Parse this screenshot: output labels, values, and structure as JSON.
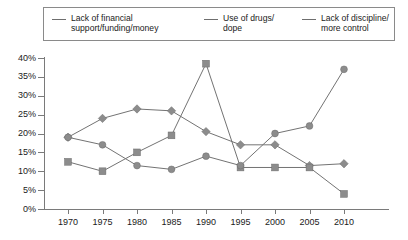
{
  "legend": {
    "items": [
      {
        "label": "Lack of financial\nsupport/funding/money",
        "marker": "diamond",
        "color": "#8c8c8c"
      },
      {
        "label": "Use of drugs/\ndope",
        "marker": "square",
        "color": "#8c8c8c"
      },
      {
        "label": "Lack of discipline/\nmore control",
        "marker": "circle",
        "color": "#8c8c8c"
      }
    ]
  },
  "axes": {
    "y_ticks": [
      "0%",
      "5%",
      "10%",
      "15%",
      "20%",
      "25%",
      "30%",
      "35%",
      "40%"
    ],
    "x_ticks": [
      "1970",
      "1975",
      "1980",
      "1985",
      "1990",
      "1995",
      "2000",
      "2005",
      "2010"
    ]
  },
  "chart_data": {
    "type": "line",
    "title": "",
    "xlabel": "",
    "ylabel": "",
    "ylim": [
      0,
      40
    ],
    "ytick_values": [
      0,
      5,
      10,
      15,
      20,
      25,
      30,
      35,
      40
    ],
    "ytick_labels": [
      "0%",
      "5%",
      "10%",
      "15%",
      "20%",
      "25%",
      "30%",
      "35%",
      "40%"
    ],
    "x": [
      1970,
      1975,
      1980,
      1985,
      1990,
      1995,
      2000,
      2005,
      2010
    ],
    "grid": false,
    "legend_position": "top",
    "series": [
      {
        "name": "Lack of financial support/funding/money",
        "marker": "diamond",
        "values": [
          19,
          24,
          26.5,
          26,
          20.5,
          17,
          17,
          11.5,
          12
        ]
      },
      {
        "name": "Use of drugs/dope",
        "marker": "square",
        "values": [
          12.5,
          10,
          15,
          19.5,
          38.5,
          11,
          11,
          11,
          4
        ]
      },
      {
        "name": "Lack of discipline/more control",
        "marker": "circle",
        "values": [
          19,
          17,
          11.5,
          10.5,
          14,
          11.5,
          20,
          22,
          37
        ]
      }
    ]
  }
}
